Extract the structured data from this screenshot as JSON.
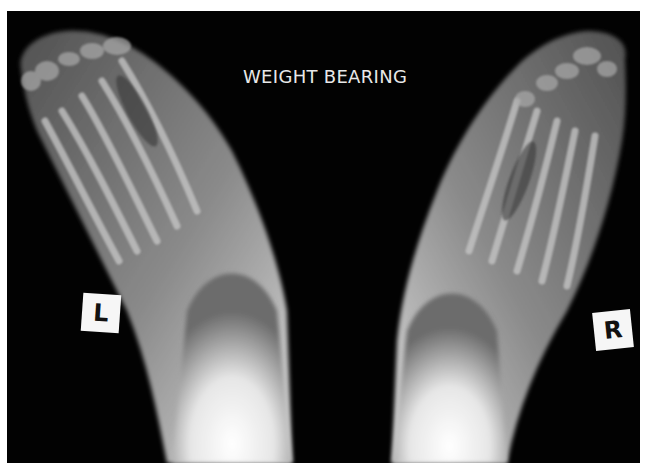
{
  "image": {
    "type": "radiograph",
    "subject": "bilateral feet, dorsoplantar view",
    "caption": "WEIGHT BEARING",
    "markers": {
      "left": "L",
      "right": "R"
    },
    "colors": {
      "background": "#030303",
      "bone": "#d8d8d8",
      "soft_tissue": "#6a6a6a",
      "marker_bg": "#f6f6f6",
      "border": "#ffffff"
    }
  }
}
